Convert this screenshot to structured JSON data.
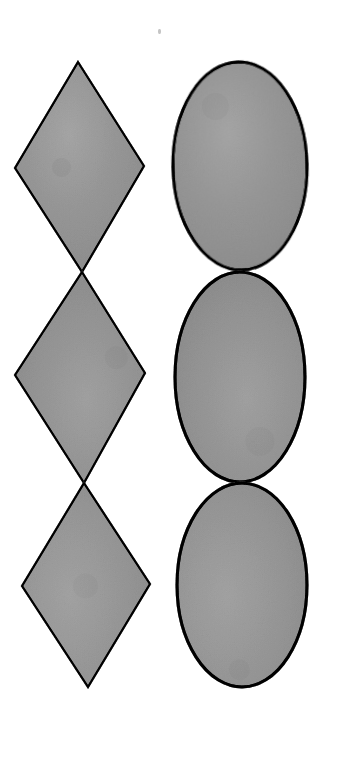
{
  "canvas": {
    "width": 342,
    "height": 761,
    "background_color": "#ffffff",
    "description": "Scanned line drawing: two vertical columns of three stacked outlined shapes on a white page"
  },
  "style": {
    "fill_color": "#c3c3c3",
    "fill_color_light": "#cfcfcf",
    "fill_color_dark": "#b6b6b6",
    "stroke_color": "#1a1a1a",
    "diamond_stroke_width": 2.1,
    "ellipse_stroke_width": 3.0
  },
  "columns": [
    {
      "name": "diamond-column",
      "shape_type": "diamond",
      "count": 3,
      "arrangement": "stacked vertically, tip-to-tip",
      "shapes": [
        {
          "label": "diamond-1",
          "points": "78,62 144,166 82,272 15,168",
          "center_x": 80,
          "center_y": 167,
          "width": 129,
          "height": 210
        },
        {
          "label": "diamond-2",
          "points": "82,272 145,373 84,483 15,375",
          "center_x": 81,
          "center_y": 377,
          "width": 130,
          "height": 211
        },
        {
          "label": "diamond-3",
          "points": "84,483 150,584 88,687 22,586",
          "center_x": 86,
          "center_y": 585,
          "width": 128,
          "height": 204
        }
      ]
    },
    {
      "name": "ellipse-column",
      "shape_type": "ellipse",
      "count": 3,
      "arrangement": "stacked vertically, tangent at top and bottom",
      "shapes": [
        {
          "label": "ellipse-1",
          "center_x": 240,
          "center_y": 166,
          "radius_x": 67,
          "radius_y": 104,
          "rotation_deg": -1
        },
        {
          "label": "ellipse-2",
          "center_x": 240,
          "center_y": 377,
          "radius_x": 65,
          "radius_y": 105,
          "rotation_deg": 0
        },
        {
          "label": "ellipse-3",
          "center_x": 242,
          "center_y": 585,
          "radius_x": 65,
          "radius_y": 102,
          "rotation_deg": 0
        }
      ]
    }
  ],
  "artifacts": {
    "stray_mark": {
      "label": "stray-speck",
      "x": 158,
      "y": 29
    }
  }
}
